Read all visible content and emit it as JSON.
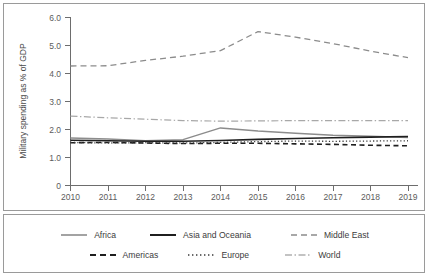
{
  "chart_data": {
    "type": "line",
    "title": "",
    "xlabel": "",
    "ylabel": "Military spending as % of GDP",
    "x": [
      2010,
      2011,
      2012,
      2013,
      2014,
      2015,
      2016,
      2017,
      2018,
      2019
    ],
    "xtick_labels": [
      "2010",
      "2011",
      "2012",
      "2013",
      "2014",
      "2015",
      "2016",
      "2017",
      "2018",
      "2019"
    ],
    "ytick_labels": [
      "0",
      "1.0",
      "2.0",
      "3.0",
      "4.0",
      "5.0",
      "6.0"
    ],
    "ytick_values": [
      0,
      1.0,
      2.0,
      3.0,
      4.0,
      5.0,
      6.0
    ],
    "ylim": [
      0,
      6.0
    ],
    "xlim": [
      2010,
      2019
    ],
    "grid": false,
    "legend_position": "bottom",
    "series": [
      {
        "name": "Africa",
        "style": "solid",
        "color": "#8c8c8c",
        "values": [
          1.68,
          1.64,
          1.58,
          1.62,
          2.04,
          1.93,
          1.85,
          1.78,
          1.74,
          1.7
        ]
      },
      {
        "name": "Asia and Oceania",
        "style": "solid",
        "color": "#1f1f1f",
        "values": [
          1.6,
          1.58,
          1.56,
          1.56,
          1.59,
          1.63,
          1.66,
          1.69,
          1.71,
          1.73
        ]
      },
      {
        "name": "Middle East",
        "style": "dashed",
        "color": "#8c8c8c",
        "values": [
          4.25,
          4.26,
          4.45,
          4.6,
          4.8,
          5.48,
          5.28,
          5.05,
          4.78,
          4.55
        ]
      },
      {
        "name": "Americas",
        "style": "dashed",
        "color": "#1f1f1f",
        "values": [
          1.51,
          1.52,
          1.5,
          1.48,
          1.49,
          1.49,
          1.47,
          1.45,
          1.42,
          1.4
        ]
      },
      {
        "name": "Europe",
        "style": "dotted",
        "color": "#3a3a3a",
        "values": [
          1.52,
          1.5,
          1.51,
          1.5,
          1.52,
          1.55,
          1.57,
          1.56,
          1.57,
          1.58
        ]
      },
      {
        "name": "World",
        "style": "dash-dot",
        "color": "#a8a8a8",
        "values": [
          2.46,
          2.4,
          2.35,
          2.3,
          2.28,
          2.29,
          2.3,
          2.3,
          2.3,
          2.3
        ]
      }
    ]
  },
  "legend": {
    "rows": [
      [
        {
          "label": "Africa",
          "key": "line-solid-gray"
        },
        {
          "label": "Asia and Oceania",
          "key": "line-solid-black"
        },
        {
          "label": "Middle East",
          "key": "line-dashed-gray"
        }
      ],
      [
        {
          "label": "Americas",
          "key": "line-dashed-black"
        },
        {
          "label": "Europe",
          "key": "line-dotted"
        },
        {
          "label": "World",
          "key": "line-dashdot-gray"
        }
      ]
    ]
  },
  "colors": {
    "frame": "#9a9a9a",
    "axis": "#6d6d6d",
    "text": "#4a4a4a",
    "background": "#ffffff"
  }
}
